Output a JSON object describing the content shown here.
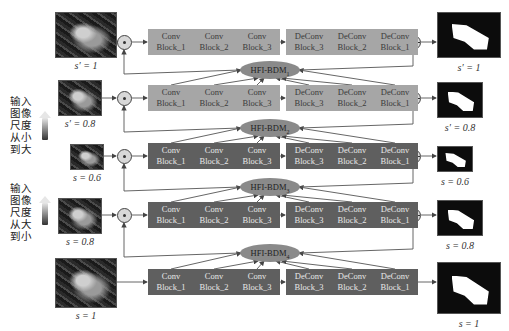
{
  "side_labels": [
    {
      "text": "输入图像尺度从小到大",
      "lines": [
        "输入",
        "图像",
        "尺度",
        "从小",
        "到大"
      ],
      "arrow_gradient": [
        "#f2f2f2",
        "#333333"
      ]
    },
    {
      "text": "输入图像尺度从大到小",
      "lines": [
        "输入",
        "图像",
        "尺度",
        "从大",
        "到小"
      ],
      "arrow_gradient": [
        "#f2f2f2",
        "#333333"
      ]
    }
  ],
  "rows": [
    {
      "scale_label": "s′ = 1",
      "output_label": "s′ = 1",
      "fusion": "⊙",
      "block_style": "light",
      "blocks": [
        {
          "l1": "Conv",
          "l2": "Block_1"
        },
        {
          "l1": "Conv",
          "l2": "Block_2"
        },
        {
          "l1": "Conv",
          "l2": "Block_3"
        },
        {
          "l1": "DeConv",
          "l2": "Block_3"
        },
        {
          "l1": "DeConv",
          "l2": "Block_2"
        },
        {
          "l1": "DeConv",
          "l2": "Block_1"
        }
      ]
    },
    {
      "scale_label": "s′ = 0.8",
      "output_label": "s′ = 0.8",
      "fusion": "⊙",
      "block_style": "light",
      "blocks": [
        {
          "l1": "Conv",
          "l2": "Block_1"
        },
        {
          "l1": "Conv",
          "l2": "Block_2"
        },
        {
          "l1": "Conv",
          "l2": "Block_3"
        },
        {
          "l1": "DeConv",
          "l2": "Block_3"
        },
        {
          "l1": "DeConv",
          "l2": "Block_2"
        },
        {
          "l1": "DeConv",
          "l2": "Block_1"
        }
      ]
    },
    {
      "scale_label": "s = 0.6",
      "output_label": "s = 0.6",
      "fusion": "⊙",
      "block_style": "dark",
      "blocks": [
        {
          "l1": "Conv",
          "l2": "Block_1"
        },
        {
          "l1": "Conv",
          "l2": "Block_2"
        },
        {
          "l1": "Conv",
          "l2": "Block_3"
        },
        {
          "l1": "DeConv",
          "l2": "Block_3"
        },
        {
          "l1": "DeConv",
          "l2": "Block_2"
        },
        {
          "l1": "DeConv",
          "l2": "Block_1"
        }
      ]
    },
    {
      "scale_label": "s = 0.8",
      "output_label": "s = 0.8",
      "fusion": "⊙",
      "block_style": "dark",
      "blocks": [
        {
          "l1": "Conv",
          "l2": "Block_1"
        },
        {
          "l1": "Conv",
          "l2": "Block_2"
        },
        {
          "l1": "Conv",
          "l2": "Block_3"
        },
        {
          "l1": "DeConv",
          "l2": "Block_3"
        },
        {
          "l1": "DeConv",
          "l2": "Block_2"
        },
        {
          "l1": "DeConv",
          "l2": "Block_1"
        }
      ]
    },
    {
      "scale_label": "s = 1",
      "output_label": "s = 1",
      "fusion": null,
      "block_style": "dark",
      "blocks": [
        {
          "l1": "Conv",
          "l2": "Block_1"
        },
        {
          "l1": "Conv",
          "l2": "Block_2"
        },
        {
          "l1": "Conv",
          "l2": "Block_3"
        },
        {
          "l1": "DeConv",
          "l2": "Block_3"
        },
        {
          "l1": "DeConv",
          "l2": "Block_2"
        },
        {
          "l1": "DeConv",
          "l2": "Block_1"
        }
      ]
    }
  ],
  "modules": [
    {
      "name": "HFI-BDM",
      "sub": "1"
    },
    {
      "name": "HFI-BDM",
      "sub": "2"
    },
    {
      "name": "HFI-BDM",
      "sub": "3"
    },
    {
      "name": "HFI-BDM",
      "sub": "4"
    }
  ],
  "colors": {
    "light_block": "#a6a6a6",
    "dark_block": "#5f5f5f",
    "module": "#8a8a8a",
    "line": "#444444"
  }
}
